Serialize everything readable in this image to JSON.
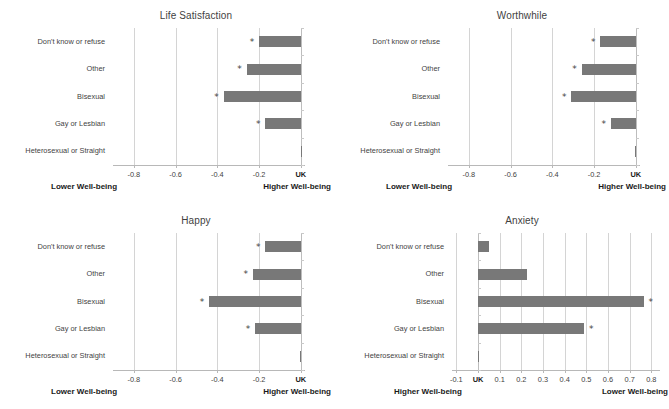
{
  "figure": {
    "categories": [
      "Don't know or refuse",
      "Other",
      "Bisexual",
      "Gay or Lesbian",
      "Heterosexual or Straight"
    ],
    "bar_color": "#787878",
    "gridline_color": "#d4d4d4",
    "significance_marker": "*"
  },
  "chart_data": [
    {
      "type": "bar",
      "orientation": "horizontal",
      "title": "Life Satisfaction",
      "categories": [
        "Don't know or refuse",
        "Other",
        "Bisexual",
        "Gay or Lesbian",
        "Heterosexual or Straight"
      ],
      "values": [
        -0.2,
        -0.26,
        -0.37,
        -0.17,
        0.0
      ],
      "significant": [
        true,
        true,
        true,
        true,
        false
      ],
      "xlabel": "",
      "ylabel": "",
      "xlim": [
        -0.9,
        0.02
      ],
      "ticks": [
        -0.8,
        -0.6,
        -0.4,
        -0.2,
        0
      ],
      "tick_labels": [
        "-0.8",
        "-0.6",
        "-0.4",
        "-0.2",
        "UK"
      ],
      "left_caption": "Lower Well-being",
      "right_caption": "Higher Well-being",
      "grid": true,
      "legend": "none"
    },
    {
      "type": "bar",
      "orientation": "horizontal",
      "title": "Worthwhile",
      "categories": [
        "Don't know or refuse",
        "Other",
        "Bisexual",
        "Gay or Lesbian",
        "Heterosexual or Straight"
      ],
      "values": [
        -0.17,
        -0.26,
        -0.31,
        -0.12,
        -0.005
      ],
      "significant": [
        true,
        true,
        true,
        true,
        false
      ],
      "xlabel": "",
      "ylabel": "",
      "xlim": [
        -0.9,
        0.02
      ],
      "ticks": [
        -0.8,
        -0.6,
        -0.4,
        -0.2,
        0
      ],
      "tick_labels": [
        "-0.8",
        "-0.6",
        "-0.4",
        "-0.2",
        "UK"
      ],
      "left_caption": "Lower Well-being",
      "right_caption": "Higher Well-being",
      "grid": true,
      "legend": "none"
    },
    {
      "type": "bar",
      "orientation": "horizontal",
      "title": "Happy",
      "categories": [
        "Don't know or refuse",
        "Other",
        "Bisexual",
        "Gay or Lesbian",
        "Heterosexual or Straight"
      ],
      "values": [
        -0.17,
        -0.23,
        -0.44,
        -0.22,
        -0.005
      ],
      "significant": [
        true,
        true,
        true,
        true,
        false
      ],
      "xlabel": "",
      "ylabel": "",
      "xlim": [
        -0.9,
        0.02
      ],
      "ticks": [
        -0.8,
        -0.6,
        -0.4,
        -0.2,
        0
      ],
      "tick_labels": [
        "-0.8",
        "-0.6",
        "-0.4",
        "-0.2",
        "UK"
      ],
      "left_caption": "Lower Well-being",
      "right_caption": "Higher Well-being",
      "grid": true,
      "legend": "none"
    },
    {
      "type": "bar",
      "orientation": "horizontal",
      "title": "Anxiety",
      "categories": [
        "Don't know or refuse",
        "Other",
        "Bisexual",
        "Gay or Lesbian",
        "Heterosexual or Straight"
      ],
      "values": [
        0.05,
        0.225,
        0.765,
        0.49,
        0.003
      ],
      "significant": [
        false,
        false,
        true,
        true,
        false
      ],
      "xlabel": "",
      "ylabel": "",
      "xlim": [
        -0.12,
        0.84
      ],
      "ticks": [
        -0.1,
        0,
        0.1,
        0.2,
        0.3,
        0.4,
        0.5,
        0.6,
        0.7,
        0.8
      ],
      "tick_labels": [
        "-0.1",
        "UK",
        "0.1",
        "0.2",
        "0.3",
        "0.4",
        "0.5",
        "0.6",
        "0.7",
        "0.8"
      ],
      "left_caption": "Higher Well-being",
      "right_caption": "Lower Well-being",
      "grid": true,
      "legend": "none"
    }
  ]
}
